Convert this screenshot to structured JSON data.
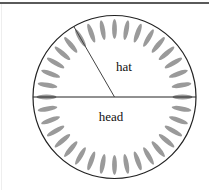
{
  "diagram": {
    "type": "circular-dial",
    "labels": {
      "upper": "hat",
      "lower": "head"
    },
    "tick_count": 36,
    "tick_step_degrees": 10,
    "pointer_angle_degrees": 120,
    "divider": "horizontal diameter",
    "colors": {
      "outline": "#222222",
      "ticks": "#9a9a9a",
      "pointer": "#444444",
      "frame": "#5a5a5a"
    }
  }
}
